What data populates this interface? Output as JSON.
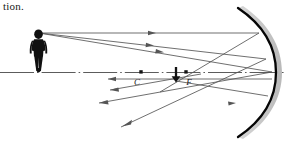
{
  "page": {
    "width": 286,
    "height": 149,
    "background": "#ffffff",
    "caption": "tion."
  },
  "figure": {
    "name": "concave-mirror-ray-diagram",
    "colors": {
      "ink": "#1a1a1a",
      "ray": "#555555",
      "axis": "#4a4a4a",
      "mirror": "#000000",
      "mirror_shadow": "#cccccc",
      "object_fill": "#111111"
    },
    "labels": {
      "center_of_curvature": "C",
      "focal_point": "F"
    },
    "points": {
      "object_head": {
        "x": 38,
        "y": 33
      },
      "object_base": {
        "x": 38,
        "y": 72
      },
      "center_of_curvature": {
        "x": 141,
        "y": 72
      },
      "focal_point": {
        "x": 186,
        "y": 72
      },
      "image_top": {
        "x": 176,
        "y": 68
      },
      "image_tip": {
        "x": 176,
        "y": 81
      },
      "mirror_vertex": {
        "x": 272,
        "y": 72
      },
      "mirror_top": {
        "x": 236,
        "y": 10
      },
      "mirror_bottom": {
        "x": 236,
        "y": 136
      }
    },
    "axis": {
      "label": "optical-axis",
      "y": 72,
      "x_start": 0,
      "x_end": 286,
      "style": "dash-dot"
    },
    "rays": [
      {
        "name": "ray-parallel-to-axis",
        "from": {
          "x": 38,
          "y": 33
        },
        "to": {
          "x": 258,
          "y": 33
        },
        "note": "parallel incident ray strikes mirror then reflects through F"
      },
      {
        "name": "ray-parallel-reflected",
        "from": {
          "x": 258,
          "y": 33
        },
        "to": {
          "x": 176,
          "y": 81
        },
        "note": "reflects through focal point toward image tip"
      },
      {
        "name": "ray-through-center",
        "from": {
          "x": 38,
          "y": 33
        },
        "to": {
          "x": 264,
          "y": 58
        },
        "note": "ray toward mirror passing through image tip region"
      },
      {
        "name": "ray-through-center-reflected",
        "from": {
          "x": 264,
          "y": 58
        },
        "to": {
          "x": 120,
          "y": 128
        },
        "note": "reflected ray continuing past image"
      },
      {
        "name": "ray-to-vertex",
        "from": {
          "x": 38,
          "y": 33
        },
        "to": {
          "x": 272,
          "y": 72
        },
        "note": "ray striking mirror vertex on the axis"
      },
      {
        "name": "ray-from-vertex-reflected",
        "from": {
          "x": 272,
          "y": 72
        },
        "to": {
          "x": 100,
          "y": 104
        },
        "note": "reflected from vertex below the axis"
      },
      {
        "name": "ray-lower-return",
        "from": {
          "x": 272,
          "y": 78
        },
        "to": {
          "x": 108,
          "y": 78
        },
        "note": "lower returning horizontal ray"
      },
      {
        "name": "ray-focus-return",
        "from": {
          "x": 186,
          "y": 72
        },
        "to": {
          "x": 110,
          "y": 90
        },
        "note": "segment leaving focal point toward the left"
      }
    ],
    "arrowheads": [
      {
        "name": "arrowhead-top-ray",
        "x": 152,
        "y": 33,
        "dir": "right"
      },
      {
        "name": "arrowhead-mid-ray",
        "x": 150,
        "y": 46,
        "dir": "right"
      },
      {
        "name": "arrowhead-vertex-ray",
        "x": 160,
        "y": 53,
        "dir": "right"
      },
      {
        "name": "arrowhead-lower-return",
        "x": 112,
        "y": 78,
        "dir": "left"
      },
      {
        "name": "arrowhead-reflected-down",
        "x": 128,
        "y": 124,
        "dir": "down-left"
      },
      {
        "name": "arrowhead-reflected-left",
        "x": 104,
        "y": 102,
        "dir": "left"
      },
      {
        "name": "arrowhead-image-tip",
        "x": 176,
        "y": 81,
        "dir": "down"
      },
      {
        "name": "arrowhead-low-right-ray",
        "x": 238,
        "y": 104,
        "dir": "right"
      }
    ],
    "object": {
      "name": "person-silhouette",
      "description": "standing human figure acting as the object",
      "x": 38,
      "top": 30,
      "bottom": 72,
      "height": 42
    },
    "image": {
      "name": "inverted-image-arrow",
      "description": "short inverted arrow representing the real image",
      "x": 176,
      "top": 67,
      "bottom": 82
    },
    "mirror": {
      "name": "concave-mirror",
      "description": "concave mirror drawn as a thick arc opening to the left",
      "thickness": 2.2
    }
  }
}
